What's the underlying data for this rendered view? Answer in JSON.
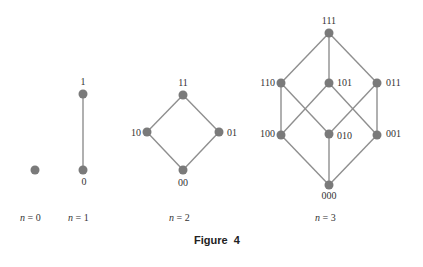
{
  "caption": {
    "figure_label": "Figure",
    "figure_number": "4"
  },
  "style": {
    "node_color": "#7a7a7a",
    "edge_color": "#8f8f8f",
    "text_color": "#333333"
  },
  "panels": [
    {
      "name": "n0",
      "label_var": "n",
      "label": " = 0",
      "nodes": [
        {
          "id": "",
          "x": 35,
          "y": 170
        }
      ],
      "edges": []
    },
    {
      "name": "n1",
      "label_var": "n",
      "label": " = 1",
      "nodes": [
        {
          "id": "1",
          "x": 83,
          "y": 94
        },
        {
          "id": "0",
          "x": 83,
          "y": 170
        }
      ],
      "edges": [
        [
          "1",
          "0"
        ]
      ]
    },
    {
      "name": "n2",
      "label_var": "n",
      "label": " = 2",
      "nodes": [
        {
          "id": "11",
          "x": 183,
          "y": 95
        },
        {
          "id": "10",
          "x": 147,
          "y": 132
        },
        {
          "id": "01",
          "x": 219,
          "y": 132
        },
        {
          "id": "00",
          "x": 183,
          "y": 170
        }
      ],
      "edges": [
        [
          "11",
          "10"
        ],
        [
          "11",
          "01"
        ],
        [
          "10",
          "00"
        ],
        [
          "01",
          "00"
        ]
      ]
    },
    {
      "name": "n3",
      "label_var": "n",
      "label": " = 3",
      "nodes": [
        {
          "id": "111",
          "x": 329,
          "y": 33
        },
        {
          "id": "110",
          "x": 281,
          "y": 83
        },
        {
          "id": "101",
          "x": 329,
          "y": 83
        },
        {
          "id": "011",
          "x": 377,
          "y": 83
        },
        {
          "id": "100",
          "x": 281,
          "y": 135
        },
        {
          "id": "010",
          "x": 329,
          "y": 134
        },
        {
          "id": "001",
          "x": 377,
          "y": 135
        },
        {
          "id": "000",
          "x": 329,
          "y": 185
        }
      ],
      "edges": [
        [
          "111",
          "110"
        ],
        [
          "111",
          "101"
        ],
        [
          "111",
          "011"
        ],
        [
          "110",
          "100"
        ],
        [
          "110",
          "010"
        ],
        [
          "101",
          "100"
        ],
        [
          "101",
          "001"
        ],
        [
          "011",
          "010"
        ],
        [
          "011",
          "001"
        ],
        [
          "100",
          "000"
        ],
        [
          "010",
          "000"
        ],
        [
          "001",
          "000"
        ]
      ]
    }
  ]
}
